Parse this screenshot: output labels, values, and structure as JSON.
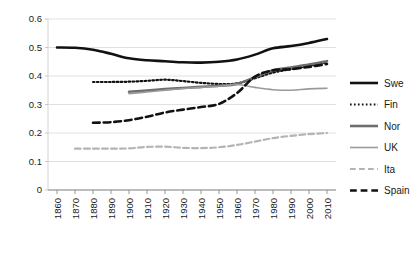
{
  "chart_data": {
    "type": "line",
    "title": "",
    "xlabel": "",
    "ylabel": "",
    "xlim": [
      1855,
      2015
    ],
    "ylim": [
      0,
      0.6
    ],
    "grid": true,
    "grid_axis": "y",
    "legend_position": "right",
    "x_ticks": [
      1860,
      1870,
      1880,
      1890,
      1900,
      1910,
      1920,
      1930,
      1940,
      1950,
      1960,
      1970,
      1980,
      1990,
      2000,
      2010
    ],
    "x_tick_labels": [
      "1860",
      "1870",
      "1880",
      "1890",
      "1900",
      "1910",
      "1920",
      "1930",
      "1940",
      "1950",
      "1960",
      "1970",
      "1980",
      "1990",
      "2000",
      "2010"
    ],
    "y_ticks": [
      0,
      0.1,
      0.2,
      0.3,
      0.4,
      0.5,
      0.6
    ],
    "y_tick_labels": [
      "0",
      "0.1",
      "0.2",
      "0.3",
      "0.4",
      "0.5",
      "0.6"
    ],
    "series": [
      {
        "name": "Swe",
        "style": "solid",
        "color": "#111111",
        "width": 2.6,
        "x": [
          1860,
          1870,
          1880,
          1890,
          1900,
          1910,
          1920,
          1930,
          1940,
          1950,
          1960,
          1970,
          1980,
          1990,
          2000,
          2010
        ],
        "values": [
          0.5,
          0.499,
          0.492,
          0.478,
          0.462,
          0.455,
          0.452,
          0.448,
          0.447,
          0.45,
          0.458,
          0.475,
          0.497,
          0.505,
          0.516,
          0.53
        ]
      },
      {
        "name": "Fin",
        "style": "dotted",
        "color": "#111111",
        "width": 2.2,
        "x": [
          1880,
          1890,
          1900,
          1910,
          1920,
          1930,
          1940,
          1950,
          1960,
          1970,
          1980,
          1990,
          2000,
          2010
        ],
        "values": [
          0.379,
          0.379,
          0.38,
          0.383,
          0.387,
          0.382,
          0.376,
          0.372,
          0.374,
          0.392,
          0.412,
          0.424,
          0.436,
          0.448
        ]
      },
      {
        "name": "Nor",
        "style": "solid",
        "color": "#6e6e6e",
        "width": 2.6,
        "x": [
          1900,
          1910,
          1920,
          1930,
          1940,
          1950,
          1960,
          1970,
          1980,
          1990,
          2000,
          2010
        ],
        "values": [
          0.345,
          0.349,
          0.354,
          0.358,
          0.362,
          0.366,
          0.372,
          0.396,
          0.42,
          0.43,
          0.44,
          0.452
        ]
      },
      {
        "name": "UK",
        "style": "solid",
        "color": "#9a9a9a",
        "width": 1.6,
        "x": [
          1900,
          1910,
          1920,
          1930,
          1940,
          1950,
          1960,
          1970,
          1980,
          1990,
          2000,
          2010
        ],
        "values": [
          0.338,
          0.344,
          0.35,
          0.356,
          0.36,
          0.364,
          0.37,
          0.36,
          0.352,
          0.35,
          0.355,
          0.357
        ]
      },
      {
        "name": "Ita",
        "style": "dashed",
        "color": "#b4b4b4",
        "width": 2.2,
        "x": [
          1870,
          1880,
          1890,
          1900,
          1910,
          1920,
          1930,
          1940,
          1950,
          1960,
          1970,
          1980,
          1990,
          2000,
          2010
        ],
        "values": [
          0.145,
          0.145,
          0.145,
          0.146,
          0.151,
          0.152,
          0.148,
          0.147,
          0.15,
          0.158,
          0.17,
          0.182,
          0.19,
          0.196,
          0.2
        ]
      },
      {
        "name": "Spain",
        "style": "dashed",
        "color": "#111111",
        "width": 2.6,
        "x": [
          1880,
          1890,
          1900,
          1910,
          1920,
          1930,
          1940,
          1950,
          1960,
          1970,
          1980,
          1990,
          2000,
          2010
        ],
        "values": [
          0.236,
          0.238,
          0.245,
          0.257,
          0.272,
          0.282,
          0.291,
          0.302,
          0.34,
          0.398,
          0.42,
          0.424,
          0.432,
          0.442
        ]
      }
    ]
  },
  "legend": {
    "items": [
      {
        "label": "Swe"
      },
      {
        "label": "Fin"
      },
      {
        "label": "Nor"
      },
      {
        "label": "UK"
      },
      {
        "label": "Ita"
      },
      {
        "label": "Spain"
      }
    ]
  }
}
